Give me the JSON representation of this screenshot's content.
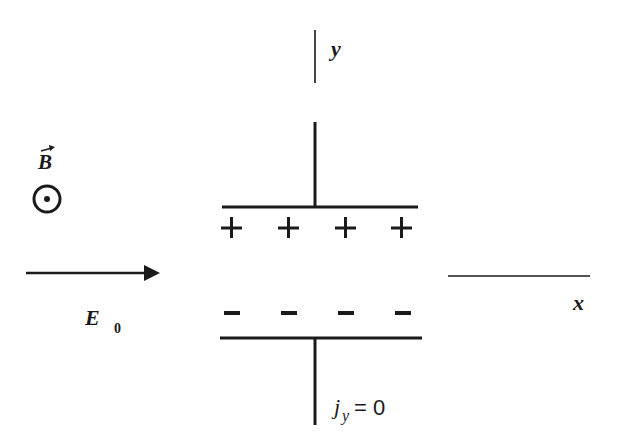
{
  "diagram": {
    "type": "Hall effect capacitor-plate schematic",
    "labels": {
      "y_axis": "y",
      "x_axis": "x",
      "magnetic_field": "B",
      "electric_field": "E",
      "electric_field_subscript": "0",
      "current_j": "j",
      "current_subscript": "y",
      "current_equation": "= 0"
    },
    "symbols": {
      "magnetic_field_direction": "out-of-page (dot in circle)",
      "top_plate_charges": [
        "+",
        "+",
        "+",
        "+"
      ],
      "bottom_plate_charges": [
        "−",
        "−",
        "−",
        "−"
      ]
    },
    "colors": {
      "ink": "#1a1a1a",
      "background": "#ffffff"
    }
  }
}
